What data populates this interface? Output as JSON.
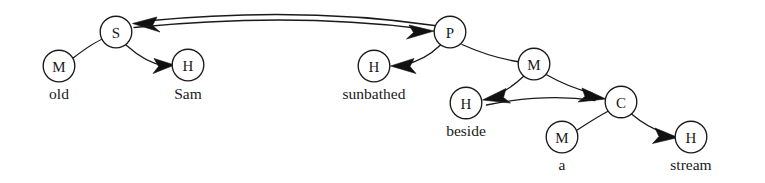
{
  "diagram": {
    "width": 765,
    "height": 183,
    "background": "#ffffff",
    "ink": "#1a1a1a",
    "node_radius": 15.8,
    "letter_font_size": 15,
    "label_font_size": 15.5,
    "nodes": [
      {
        "id": "m_old",
        "letter": "M",
        "label": "old",
        "cx": 59,
        "cy": 66,
        "label_x": 59,
        "label_y": 99
      },
      {
        "id": "s_top",
        "letter": "S",
        "label": "",
        "cx": 116,
        "cy": 32,
        "label_x": 116,
        "label_y": 0
      },
      {
        "id": "h_sam",
        "letter": "H",
        "label": "Sam",
        "cx": 188,
        "cy": 65,
        "label_x": 188,
        "label_y": 99
      },
      {
        "id": "p_top",
        "letter": "P",
        "label": "",
        "cx": 450,
        "cy": 32,
        "label_x": 450,
        "label_y": 0
      },
      {
        "id": "h_sunbathed",
        "letter": "H",
        "label": "sunbathed",
        "cx": 374,
        "cy": 66,
        "label_x": 374,
        "label_y": 99
      },
      {
        "id": "m_beside",
        "letter": "M",
        "label": "",
        "cx": 534,
        "cy": 64,
        "label_x": 534,
        "label_y": 0
      },
      {
        "id": "h_beside",
        "letter": "H",
        "label": "beside",
        "cx": 466,
        "cy": 103,
        "label_x": 466,
        "label_y": 136
      },
      {
        "id": "c_node",
        "letter": "C",
        "label": "",
        "cx": 621,
        "cy": 102,
        "label_x": 621,
        "label_y": 0
      },
      {
        "id": "m_a",
        "letter": "M",
        "label": "a",
        "cx": 562,
        "cy": 137,
        "label_x": 562,
        "label_y": 170
      },
      {
        "id": "h_stream",
        "letter": "H",
        "label": "stream",
        "cx": 691,
        "cy": 137,
        "label_x": 691,
        "label_y": 170
      }
    ],
    "edges": [
      {
        "id": "e-m_old-s",
        "from": "m_old",
        "to": "s_top",
        "arrow": "none",
        "note": "M(old) to S, plain curve"
      },
      {
        "id": "e-s-h_sam",
        "from": "s_top",
        "to": "h_sam",
        "arrow": "target",
        "note": "S to H(Sam), arrowhead at H"
      },
      {
        "id": "e-s-p-upper",
        "from": "p_top",
        "to": "s_top",
        "arrow": "target",
        "note": "long upper arc, arrowhead at S"
      },
      {
        "id": "e-s-p-lower",
        "from": "s_top",
        "to": "p_top",
        "arrow": "target",
        "note": "long lower arc, arrowhead at P"
      },
      {
        "id": "e-p-h_sunbathed",
        "from": "p_top",
        "to": "h_sunbathed",
        "arrow": "target",
        "note": "P to H(sunbathed), arrowhead at H"
      },
      {
        "id": "e-m_beside-h_beside",
        "from": "m_beside",
        "to": "h_beside",
        "arrow": "target",
        "note": "M to H(beside), arrowhead at H"
      },
      {
        "id": "e-m_beside-c-upper",
        "from": "m_beside",
        "to": "c_node",
        "arrow": "target",
        "note": "M to C, arrowhead at C"
      },
      {
        "id": "e-h_beside-c",
        "from": "h_beside",
        "to": "c_node",
        "arrow": "target",
        "note": "second arc H(beside) to C, arrowhead at C"
      },
      {
        "id": "e-m_a-c",
        "from": "m_a",
        "to": "c_node",
        "arrow": "none",
        "note": "M(a) to C, plain curve"
      },
      {
        "id": "e-c-h_stream",
        "from": "c_node",
        "to": "h_stream",
        "arrow": "target",
        "note": "C to H(stream), arrowhead at H"
      }
    ],
    "legend_letters": {
      "M": "Modifier",
      "S": "Subject",
      "H": "Head",
      "P": "Predicate",
      "C": "Complement"
    }
  }
}
